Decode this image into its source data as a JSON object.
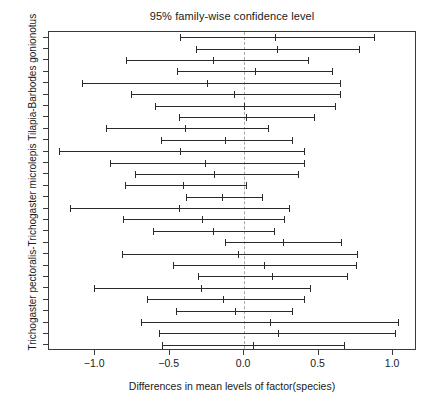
{
  "chart_data": {
    "type": "line",
    "title": "95% family-wise confidence level",
    "xlabel": "Differences in mean levels of factor(species)",
    "ylabel": "Trichogaster pectoralis-Trichogaster microlepis  Tilapia-Barbodes gonionotus",
    "xlim": [
      -1.31,
      1.16
    ],
    "xticks": [
      -1.0,
      -0.5,
      0.0,
      0.5,
      1.0
    ],
    "xticklabels": [
      "−1.0",
      "−0.5",
      "0.0",
      "0.5",
      "1.0"
    ],
    "grid": false,
    "legend": null,
    "reference_line": 0.0,
    "reference_line_style": "dashed",
    "n_intervals": 28,
    "series": [
      {
        "name": "interval-1",
        "lower": -0.43,
        "estimate": 0.21,
        "upper": 0.87
      },
      {
        "name": "interval-2",
        "lower": -0.32,
        "estimate": 0.22,
        "upper": 0.77
      },
      {
        "name": "interval-3",
        "lower": -0.79,
        "estimate": -0.21,
        "upper": 0.43
      },
      {
        "name": "interval-4",
        "lower": -0.45,
        "estimate": 0.07,
        "upper": 0.59
      },
      {
        "name": "interval-5",
        "lower": -1.09,
        "estimate": -0.25,
        "upper": 0.64
      },
      {
        "name": "interval-6",
        "lower": -0.76,
        "estimate": -0.07,
        "upper": 0.64
      },
      {
        "name": "interval-7",
        "lower": -0.6,
        "estimate": 0.0,
        "upper": 0.61
      },
      {
        "name": "interval-8",
        "lower": -0.44,
        "estimate": 0.01,
        "upper": 0.47
      },
      {
        "name": "interval-9",
        "lower": -0.93,
        "estimate": -0.4,
        "upper": 0.16
      },
      {
        "name": "interval-10",
        "lower": -0.56,
        "estimate": -0.13,
        "upper": 0.32
      },
      {
        "name": "interval-11",
        "lower": -1.24,
        "estimate": -0.43,
        "upper": 0.4
      },
      {
        "name": "interval-12",
        "lower": -0.9,
        "estimate": -0.26,
        "upper": 0.4
      },
      {
        "name": "interval-13",
        "lower": -0.73,
        "estimate": -0.2,
        "upper": 0.36
      },
      {
        "name": "interval-14",
        "lower": -0.8,
        "estimate": -0.41,
        "upper": 0.01
      },
      {
        "name": "interval-15",
        "lower": -0.39,
        "estimate": -0.15,
        "upper": 0.12
      },
      {
        "name": "interval-16",
        "lower": -1.17,
        "estimate": -0.44,
        "upper": 0.3
      },
      {
        "name": "interval-17",
        "lower": -0.81,
        "estimate": -0.28,
        "upper": 0.27
      },
      {
        "name": "interval-18",
        "lower": -0.61,
        "estimate": -0.21,
        "upper": 0.2
      },
      {
        "name": "interval-19",
        "lower": -0.13,
        "estimate": 0.26,
        "upper": 0.65
      },
      {
        "name": "interval-20",
        "lower": -0.82,
        "estimate": -0.04,
        "upper": 0.76
      },
      {
        "name": "interval-21",
        "lower": -0.48,
        "estimate": 0.13,
        "upper": 0.75
      },
      {
        "name": "interval-22",
        "lower": -0.31,
        "estimate": 0.19,
        "upper": 0.69
      },
      {
        "name": "interval-23",
        "lower": -1.01,
        "estimate": -0.29,
        "upper": 0.44
      },
      {
        "name": "interval-24",
        "lower": -0.65,
        "estimate": -0.14,
        "upper": 0.4
      },
      {
        "name": "interval-25",
        "lower": -0.46,
        "estimate": -0.06,
        "upper": 0.32
      },
      {
        "name": "interval-26",
        "lower": -0.69,
        "estimate": 0.17,
        "upper": 1.03
      },
      {
        "name": "interval-27",
        "lower": -0.57,
        "estimate": 0.23,
        "upper": 1.01
      },
      {
        "name": "interval-28",
        "lower": -0.55,
        "estimate": 0.06,
        "upper": 0.67
      }
    ]
  },
  "colors": {
    "interval": "#2b2b2b",
    "reference_line": "#a8a8a8",
    "axis": "#3a3a3a",
    "text": "#1a1a1a",
    "background": "#ffffff"
  }
}
